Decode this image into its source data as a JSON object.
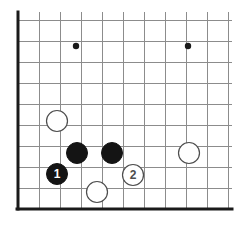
{
  "figure": {
    "type": "go-board-diagram",
    "background_color": "#ffffff"
  },
  "board": {
    "corner": "bottom-left",
    "grid_spacing_px": 21,
    "origin_x_px": 18,
    "origin_y_px": 209,
    "columns": 11,
    "rows": 10,
    "edge_color": "#1a1a1a",
    "edge_width_px": 3,
    "grid_color": "#8c8c8c",
    "grid_width_px": 1,
    "top_clipped": true,
    "first_line_x_px": 18,
    "first_line_y_px": 209,
    "grid_right_px": 232,
    "grid_top_px": 12
  },
  "star_points": {
    "color": "#1a1a1a",
    "radius_px": 3.2,
    "points": [
      {
        "name": "star-point-left",
        "x": 76,
        "y": 46
      },
      {
        "name": "star-point-right",
        "x": 188,
        "y": 46
      }
    ]
  },
  "stones": {
    "radius_px": 10.5,
    "black_fill": "#141414",
    "black_stroke": "#141414",
    "white_fill": "#ffffff",
    "white_stroke": "#4d4d4d",
    "black_label_color": "#ffffff",
    "white_label_color": "#4d4d4d",
    "items": [
      {
        "name": "white-stone-upper-left",
        "color": "white",
        "x": 57,
        "y": 121,
        "label": ""
      },
      {
        "name": "black-stone-left",
        "color": "black",
        "x": 77,
        "y": 153,
        "label": ""
      },
      {
        "name": "black-stone-right",
        "color": "black",
        "x": 112,
        "y": 153,
        "label": ""
      },
      {
        "name": "white-stone-right",
        "color": "white",
        "x": 189,
        "y": 153,
        "label": ""
      },
      {
        "name": "black-stone-move-1",
        "color": "black",
        "x": 57,
        "y": 174,
        "label": "1"
      },
      {
        "name": "white-stone-move-2",
        "color": "white",
        "x": 133,
        "y": 175,
        "label": "2"
      },
      {
        "name": "white-stone-bottom",
        "color": "white",
        "x": 97,
        "y": 192,
        "label": ""
      }
    ]
  },
  "move_labels": [
    {
      "number": "1",
      "color": "black"
    },
    {
      "number": "2",
      "color": "white"
    }
  ]
}
